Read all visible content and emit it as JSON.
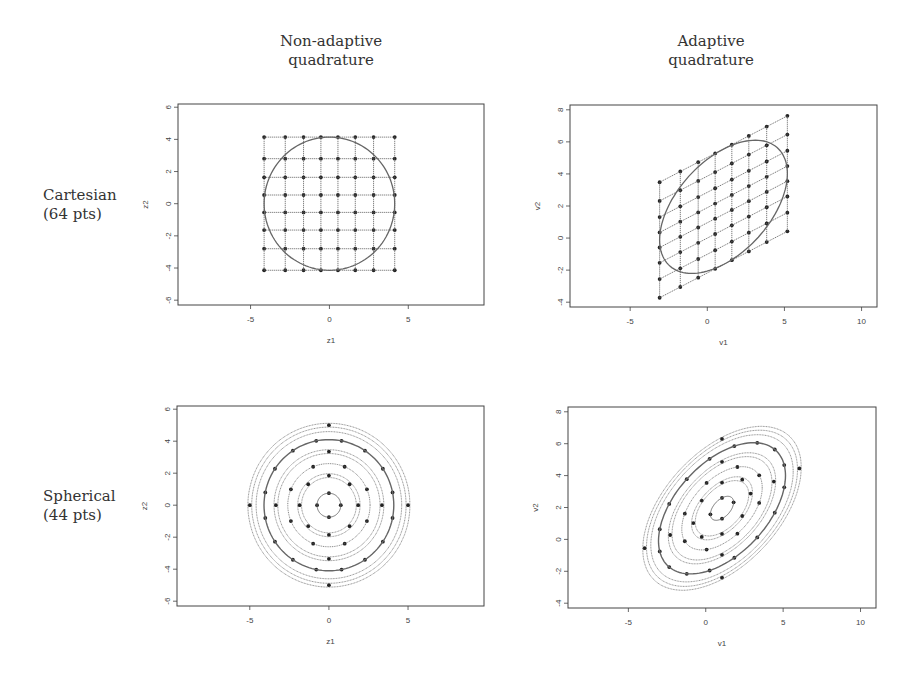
{
  "column_titles": {
    "left": [
      "Non-adaptive",
      "quadrature"
    ],
    "right": [
      "Adaptive",
      "quadrature"
    ]
  },
  "row_labels": {
    "top": [
      "Cartesian",
      "(64 pts)"
    ],
    "bottom": [
      "Spherical",
      "(44 pts)"
    ]
  },
  "colors": {
    "ink": "#222222",
    "grid": "#555555",
    "contour": "#666666",
    "frame": "#444444"
  },
  "chart_data": [
    {
      "id": "cartesian-nonadaptive",
      "type": "scatter",
      "title": "Cartesian (64 pts) – Non-adaptive quadrature",
      "xlabel": "z1",
      "ylabel": "z2",
      "xlim": [
        -9.6,
        9.8
      ],
      "ylim": [
        -6.3,
        6.2
      ],
      "xticks": [
        -5,
        0,
        5
      ],
      "yticks": [
        -6,
        -4,
        -2,
        0,
        2,
        4,
        6
      ],
      "grid_nodes": [
        -4.14,
        -2.8,
        -1.64,
        -0.54,
        0.54,
        1.64,
        2.8,
        4.14
      ],
      "grid_kind": "product",
      "contour": {
        "kind": "circle",
        "cx": 0,
        "cy": 0,
        "r": 4.14
      },
      "n_points": 64
    },
    {
      "id": "cartesian-adaptive",
      "type": "scatter",
      "title": "Cartesian (64 pts) – Adaptive quadrature",
      "xlabel": "v1",
      "ylabel": "v2",
      "xlim": [
        -8.9,
        11.0
      ],
      "ylim": [
        -4.3,
        8.3
      ],
      "xticks": [
        -5,
        0,
        5,
        10
      ],
      "yticks": [
        -4,
        -2,
        0,
        2,
        4,
        6,
        8
      ],
      "grid_nodes": [
        -4.14,
        -2.8,
        -1.64,
        -0.54,
        0.54,
        1.64,
        2.8,
        4.14
      ],
      "grid_kind": "sheared",
      "transform": {
        "mx": 1.05,
        "my": 1.95,
        "sx": 1.0,
        "slope": 0.5,
        "sy": 0.87
      },
      "contour": {
        "kind": "transformed-circle",
        "r": 4.14
      },
      "n_points": 64
    },
    {
      "id": "spherical-nonadaptive",
      "type": "scatter",
      "title": "Spherical (44 pts) – Non-adaptive quadrature",
      "xlabel": "z1",
      "ylabel": "z2",
      "xlim": [
        -9.6,
        9.8
      ],
      "ylim": [
        -6.3,
        6.2
      ],
      "xticks": [
        -5,
        0,
        5
      ],
      "yticks": [
        -6,
        -4,
        -2,
        0,
        2,
        4,
        6
      ],
      "rings": [
        {
          "r": 0.75,
          "n": 4,
          "offset_deg": 0,
          "style": "solid"
        },
        {
          "r": 1.85,
          "n": 8,
          "offset_deg": 0,
          "style": "double"
        },
        {
          "r": 2.6,
          "n": 8,
          "offset_deg": 22.5,
          "style": "dotted"
        },
        {
          "r": 3.35,
          "n": 4,
          "offset_deg": 0,
          "style": "double"
        },
        {
          "r": 4.1,
          "n": 16,
          "offset_deg": 11.25,
          "style": "solid"
        },
        {
          "r": 5.0,
          "n": 4,
          "offset_deg": 0,
          "style": "double"
        }
      ],
      "n_points": 44
    },
    {
      "id": "spherical-adaptive",
      "type": "scatter",
      "title": "Spherical (44 pts) – Adaptive quadrature",
      "xlabel": "v1",
      "ylabel": "v2",
      "xlim": [
        -8.9,
        11.0
      ],
      "ylim": [
        -4.3,
        8.3
      ],
      "xticks": [
        -5,
        0,
        5,
        10
      ],
      "yticks": [
        -4,
        -2,
        0,
        2,
        4,
        6,
        8
      ],
      "transform": {
        "mx": 1.05,
        "my": 1.95,
        "sx": 1.0,
        "slope": 0.5,
        "sy": 0.87
      },
      "rings": [
        {
          "r": 0.75,
          "n": 4,
          "offset_deg": 0,
          "style": "solid"
        },
        {
          "r": 1.85,
          "n": 8,
          "offset_deg": 0,
          "style": "double"
        },
        {
          "r": 2.6,
          "n": 8,
          "offset_deg": 22.5,
          "style": "dotted"
        },
        {
          "r": 3.35,
          "n": 4,
          "offset_deg": 0,
          "style": "double"
        },
        {
          "r": 4.1,
          "n": 16,
          "offset_deg": 11.25,
          "style": "solid"
        },
        {
          "r": 5.0,
          "n": 4,
          "offset_deg": 0,
          "style": "double"
        }
      ],
      "n_points": 44
    }
  ],
  "panels_px": [
    {
      "box": [
        178,
        104,
        484,
        305
      ]
    },
    {
      "box": [
        570,
        105,
        877,
        307
      ]
    },
    {
      "box": [
        177,
        406,
        484,
        606
      ]
    },
    {
      "box": [
        568,
        407,
        876,
        608
      ]
    }
  ]
}
